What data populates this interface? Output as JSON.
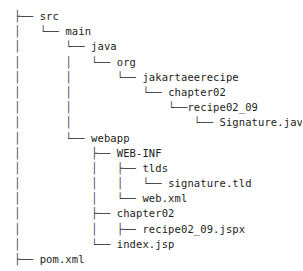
{
  "tree": {
    "title": "project directory tree",
    "root_connector_glyphs": {
      "tee": "├──",
      "elbow": "└──",
      "pipe": "│",
      "dash": "─"
    },
    "colors": {
      "background": "#ffffff",
      "text": "#1b1d21",
      "branch": "#3a3d42"
    },
    "lines": [
      {
        "prefix": "├── ",
        "label": "src"
      },
      {
        "prefix": "│   └── ",
        "label": "main"
      },
      {
        "prefix": "│       └── ",
        "label": "java"
      },
      {
        "prefix": "│       │   └── ",
        "label": "org"
      },
      {
        "prefix": "│       │       └── ",
        "label": "jakartaeerecipe"
      },
      {
        "prefix": "│       │           └── ",
        "label": "chapter02"
      },
      {
        "prefix": "│       │               └──",
        "label": "recipe02_09"
      },
      {
        "prefix": "│       │                   └── ",
        "label": "Signature.java"
      },
      {
        "prefix": "│       └── ",
        "label": "webapp"
      },
      {
        "prefix": "│           ├── ",
        "label": "WEB-INF"
      },
      {
        "prefix": "│           │   ├── ",
        "label": "tlds"
      },
      {
        "prefix": "│           │   │   └── ",
        "label": "signature.tld"
      },
      {
        "prefix": "│           │   └── ",
        "label": "web.xml"
      },
      {
        "prefix": "│           ├── ",
        "label": "chapter02"
      },
      {
        "prefix": "│           │   ├── ",
        "label": "recipe02_09.jspx"
      },
      {
        "prefix": "│           └── ",
        "label": "index.jsp"
      },
      {
        "prefix": "├── ",
        "label": "pom.xml"
      }
    ]
  }
}
